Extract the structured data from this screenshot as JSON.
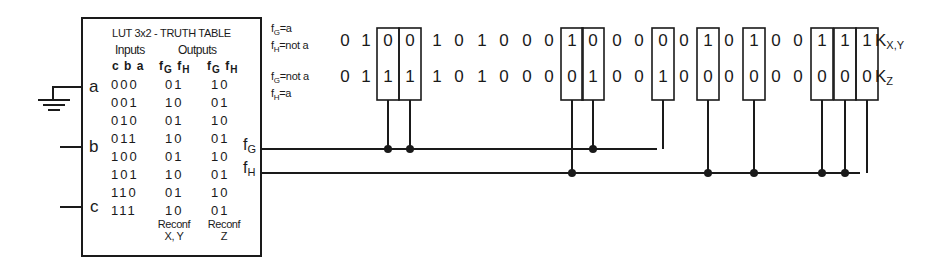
{
  "lut": {
    "title": "LUT 3x2 - TRUTH TABLE",
    "inputs_header": "Inputs",
    "outputs_header": "Outputs",
    "input_cols": "c b a",
    "output_cols_1": {
      "g": "f",
      "g_sub": "G",
      "h": "f",
      "h_sub": "H"
    },
    "output_cols_2": {
      "g": "f",
      "g_sub": "G",
      "h": "f",
      "h_sub": "H"
    },
    "rows": [
      {
        "cba": "000",
        "out1": "01",
        "out2": "10"
      },
      {
        "cba": "001",
        "out1": "10",
        "out2": "01"
      },
      {
        "cba": "010",
        "out1": "01",
        "out2": "10"
      },
      {
        "cba": "011",
        "out1": "10",
        "out2": "01"
      },
      {
        "cba": "100",
        "out1": "01",
        "out2": "10"
      },
      {
        "cba": "101",
        "out1": "10",
        "out2": "01"
      },
      {
        "cba": "110",
        "out1": "01",
        "out2": "10"
      },
      {
        "cba": "111",
        "out1": "10",
        "out2": "01"
      }
    ],
    "footer_1": {
      "line1": "Reconf",
      "line2": "X, Y"
    },
    "footer_2": {
      "line1": "Reconf",
      "line2": "Z"
    },
    "pins": {
      "a": "a",
      "b": "b",
      "c": "c"
    },
    "outputs": {
      "fG": {
        "base": "f",
        "sub": "G"
      },
      "fH": {
        "base": "f",
        "sub": "H"
      }
    }
  },
  "conditions": {
    "row1": {
      "line1_base": "f",
      "line1_sub": "G",
      "line1_rest": "=a",
      "line2_base": "f",
      "line2_sub": "H",
      "line2_rest": "=not a"
    },
    "row2": {
      "line1_base": "f",
      "line1_sub": "G",
      "line1_rest": "=not a",
      "line2_base": "f",
      "line2_sub": "H",
      "line2_rest": "=a"
    }
  },
  "sequences": {
    "kxy": {
      "label_base": "K",
      "label_sub": "X,Y",
      "bits": [
        "0",
        "1",
        "0",
        "0",
        "1",
        "0",
        "1",
        "0",
        "0",
        "0",
        "1",
        "0",
        "0",
        "0",
        "0",
        "0",
        "1",
        "0",
        "1",
        "0",
        "0",
        "1",
        "1",
        "1"
      ]
    },
    "kz": {
      "label_base": "K",
      "label_sub": "Z",
      "bits": [
        "0",
        "1",
        "1",
        "1",
        "1",
        "0",
        "1",
        "0",
        "0",
        "0",
        "0",
        "1",
        "0",
        "0",
        "1",
        "0",
        "0",
        "0",
        "0",
        "0",
        "0",
        "0",
        "0",
        "0"
      ]
    },
    "boxed_columns": [
      2,
      3,
      10,
      11,
      14,
      16,
      18,
      21,
      22,
      23
    ],
    "connections": {
      "fG": [
        2,
        3,
        11,
        14
      ],
      "fH": [
        10,
        16,
        18,
        21,
        22,
        23
      ]
    }
  },
  "colors": {
    "ink": "#1a1a1a",
    "background": "#ffffff"
  }
}
